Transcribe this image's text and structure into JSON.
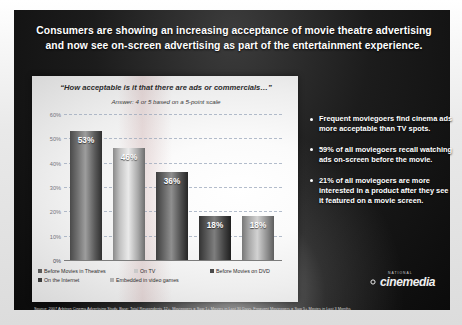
{
  "slide": {
    "title_line1": "Consumers are showing an increasing acceptance of movie theatre advertising",
    "title_line2": "and now see on-screen advertising as part of the entertainment experience.",
    "source_note": "Source: 2007 Arbitron Cinema Advertising Study, Base: Total Respondents 12+, Moviegoers = Saw 1+ Movies in Last 30 Days, Frequent Moviegoers = Saw 5+ Movies in Last 3 Months"
  },
  "chart_data": {
    "type": "bar",
    "title": "“How acceptable is it that there are ads or commercials…”",
    "subtitle": "Answer: 4 or 5 based on a 5-point scale",
    "categories": [
      "Before Movies in Theatres",
      "On TV",
      "Before Movies on DVD",
      "On the Internet",
      "Embedded in video games"
    ],
    "values": [
      53,
      46,
      36,
      18,
      18
    ],
    "value_labels": [
      "53%",
      "46%",
      "36%",
      "18%",
      "18%"
    ],
    "xlabel": "",
    "ylabel": "",
    "ylim": [
      0,
      60
    ],
    "ytick_labels": [
      "0%",
      "10%",
      "20%",
      "30%",
      "40%",
      "50%",
      "60%"
    ],
    "ytick_values": [
      0,
      10,
      20,
      30,
      40,
      50,
      60
    ],
    "grid": true,
    "legend_position": "bottom",
    "series_colors": [
      "#5b5b5b",
      "#c9c9c9",
      "#4a4a4a",
      "#3a3a3a",
      "#b0b0b0"
    ]
  },
  "bullets": [
    "Frequent moviegoers find cinema ads more acceptable than TV spots.",
    "59% of all moviegoers recall watching ads on-screen before the movie.",
    "21% of all moviegoers are more interested in a product after they see it featured on a movie screen."
  ],
  "logo": {
    "tagline": "NATIONAL",
    "word": "cinemedia"
  }
}
